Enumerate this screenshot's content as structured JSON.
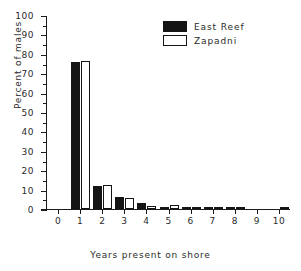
{
  "chart_data": {
    "type": "bar",
    "title": "",
    "xlabel": "Years present on shore",
    "ylabel": "Percent of males",
    "categories": [
      "0",
      "1",
      "2",
      "3",
      "4",
      "5",
      "6",
      "7",
      "8",
      "9",
      "10"
    ],
    "x": [
      0,
      1,
      2,
      3,
      4,
      5,
      6,
      7,
      8,
      9,
      10
    ],
    "series": [
      {
        "name": "East Reef",
        "color": "#151515",
        "values": [
          0,
          76,
          12,
          6,
          3,
          1.2,
          0.4,
          0.2,
          0.3,
          0,
          0
        ]
      },
      {
        "name": "Zapadni",
        "color": "#ffffff",
        "values": [
          0,
          76.5,
          12.2,
          5.6,
          1.6,
          2,
          0.3,
          0.2,
          0.2,
          0,
          0.4
        ]
      }
    ],
    "ylim": [
      0,
      100
    ],
    "yticks": [
      0,
      10,
      20,
      30,
      40,
      50,
      60,
      70,
      80,
      90,
      100
    ],
    "ytick_minor_step": 5,
    "xlim": [
      -0.55,
      10.5
    ],
    "xticks": [
      0,
      1,
      2,
      3,
      4,
      5,
      6,
      7,
      8,
      9,
      10
    ],
    "grid": false,
    "legend_position": "top-right"
  },
  "legend": {
    "entries": [
      {
        "label": "East Reef",
        "swatch": "filled-black"
      },
      {
        "label": "Zapadni",
        "swatch": "outline-white"
      }
    ]
  }
}
